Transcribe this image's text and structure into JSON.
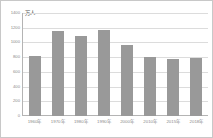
{
  "chart_data": {
    "type": "bar",
    "title": "",
    "subtitle": "",
    "unit_label": "万人",
    "xlabel": "",
    "ylabel": "",
    "categories": [
      "1960年",
      "1970年",
      "1980年",
      "1990年",
      "2000年",
      "2010年",
      "2015年",
      "2018年"
    ],
    "values": [
      810,
      1160,
      1090,
      1175,
      970,
      800,
      770,
      790
    ],
    "series": [
      {
        "name": "人口",
        "values": [
          810,
          1160,
          1090,
          1175,
          970,
          800,
          770,
          790
        ]
      }
    ],
    "ylim": [
      0,
      1400
    ],
    "ytick_values": [
      0,
      200,
      400,
      600,
      800,
      1000,
      1200,
      1400
    ],
    "ytick_labels": [
      "0",
      "200",
      "400",
      "600",
      "800",
      "1000",
      "1200",
      "1400"
    ],
    "grid": true,
    "legend": false,
    "legend_position": "none",
    "bar_color": "#999999",
    "gridline_color": "#dcdcdc",
    "axis_color": "#b4b4b4",
    "tick_text_color": "#8a8a8a",
    "background_color": "#ffffff",
    "border_color": "#c8c8c8"
  }
}
